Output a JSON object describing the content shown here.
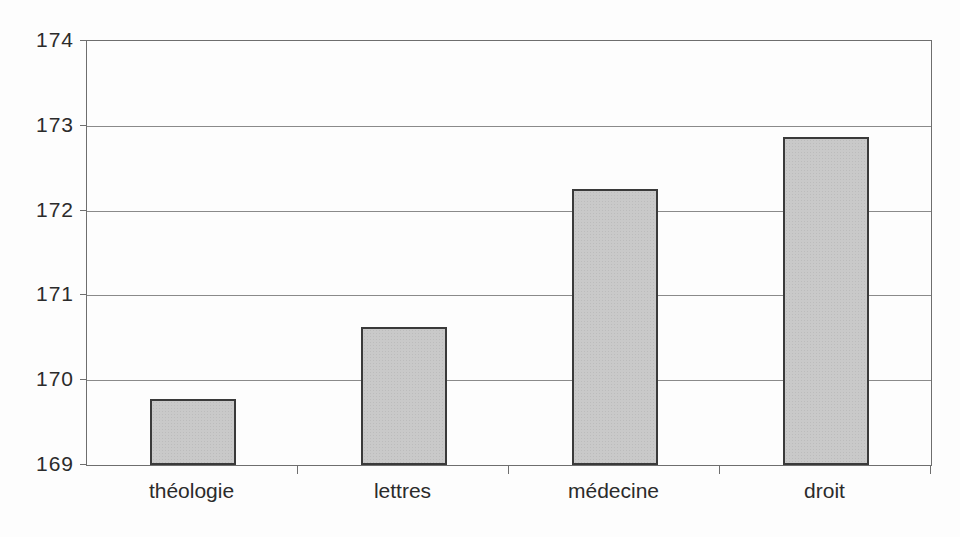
{
  "chart_data": {
    "type": "bar",
    "title": "",
    "xlabel": "",
    "ylabel": "",
    "categories": [
      "théologie",
      "lettres",
      "médecine",
      "droit"
    ],
    "values": [
      169.78,
      170.63,
      172.25,
      172.87
    ],
    "ylim": [
      169,
      174
    ],
    "yticks": [
      169,
      170,
      171,
      172,
      173,
      174
    ],
    "grid": true,
    "legend": false,
    "colors": {
      "bar_fill": "#c9c9c9",
      "bar_border": "#3a3a3a",
      "gridline": "#8a8a8a",
      "frame": "#6e6e6e",
      "text": "#2b2b2b",
      "background": "#fdfdfd"
    }
  }
}
